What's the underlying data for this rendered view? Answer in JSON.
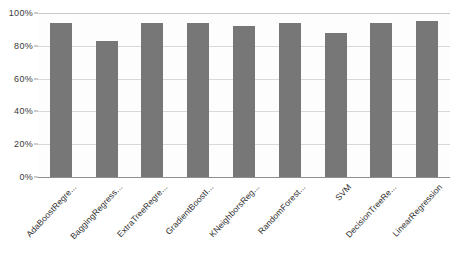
{
  "chart_data": {
    "type": "bar",
    "title": "",
    "subtitle": "",
    "xlabel": "",
    "ylabel": "",
    "ylim": [
      0,
      100
    ],
    "grid": true,
    "legend": false,
    "y_tick_labels": [
      "0%",
      "20%",
      "40%",
      "60%",
      "80%",
      "100%"
    ],
    "y_tick_values": [
      0,
      20,
      40,
      60,
      80,
      100
    ],
    "categories": [
      "AdaBoostRegre...",
      "BaggingRegress...",
      "ExtraTreeRegre...",
      "GradientBoostI...",
      "KNeighborsReg...",
      "RandomForest...",
      "SVM",
      "DecisionTreeRe...",
      "LinearRegression"
    ],
    "values": [
      94,
      83,
      94,
      94,
      92,
      94,
      88,
      94,
      95
    ],
    "series": [
      {
        "name": "Accuracy",
        "values": [
          94,
          83,
          94,
          94,
          92,
          94,
          88,
          94,
          95
        ]
      }
    ],
    "colors": {
      "bar": "#777777",
      "gridline": "#d8d8d8",
      "axis": "#8f8f8f",
      "tick_text": "#3a3a3a",
      "plot_background": "#fdfdfd",
      "page_background": "#ffffff"
    }
  }
}
